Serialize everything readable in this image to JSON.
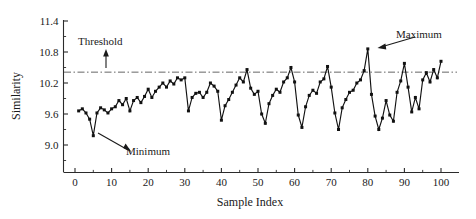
{
  "chart_data": {
    "type": "line",
    "title": "",
    "xlabel": "Sample Index",
    "ylabel": "Similarity",
    "xlim": [
      -2,
      104
    ],
    "ylim": [
      8.7,
      11.45
    ],
    "grid": false,
    "legend": null,
    "y_ticks": [
      "9.0",
      "9.6",
      "10.2",
      "10.8",
      "11.4"
    ],
    "y_tick_values": [
      9.0,
      9.6,
      10.2,
      10.8,
      11.4
    ],
    "x_ticks": [
      "0",
      "10",
      "20",
      "30",
      "40",
      "50",
      "60",
      "70",
      "80",
      "90",
      "100"
    ],
    "x_tick_values": [
      0,
      10,
      20,
      30,
      40,
      50,
      60,
      70,
      80,
      90,
      100
    ],
    "minor_ticks": true,
    "marker": "square",
    "series": [
      {
        "name": "Similarity",
        "x": [
          1,
          2,
          3,
          4,
          5,
          6,
          7,
          8,
          9,
          10,
          11,
          12,
          13,
          14,
          15,
          16,
          17,
          18,
          19,
          20,
          21,
          22,
          23,
          24,
          25,
          26,
          27,
          28,
          29,
          30,
          31,
          32,
          33,
          34,
          35,
          36,
          37,
          38,
          39,
          40,
          41,
          42,
          43,
          44,
          45,
          46,
          47,
          48,
          49,
          50,
          51,
          52,
          53,
          54,
          55,
          56,
          57,
          58,
          59,
          60,
          61,
          62,
          63,
          64,
          65,
          66,
          67,
          68,
          69,
          70,
          71,
          72,
          73,
          74,
          75,
          76,
          77,
          78,
          79,
          80,
          81,
          82,
          83,
          84,
          85,
          86,
          87,
          88,
          89,
          90,
          91,
          92,
          93,
          94,
          95,
          96,
          97,
          98,
          99,
          100
        ],
        "values": [
          9.66,
          9.7,
          9.62,
          9.5,
          9.18,
          9.62,
          9.72,
          9.68,
          9.62,
          9.7,
          9.74,
          9.86,
          9.78,
          9.9,
          9.66,
          9.86,
          9.92,
          9.82,
          9.94,
          10.08,
          9.92,
          10.04,
          10.12,
          10.2,
          10.12,
          10.24,
          10.18,
          10.3,
          10.26,
          10.3,
          9.66,
          9.92,
          10.0,
          10.02,
          9.92,
          10.02,
          10.2,
          10.14,
          10.04,
          9.48,
          9.76,
          9.88,
          10.02,
          10.16,
          10.3,
          10.22,
          10.46,
          10.1,
          9.98,
          10.04,
          9.6,
          9.42,
          9.8,
          9.96,
          10.08,
          10.02,
          10.22,
          10.3,
          10.5,
          10.22,
          9.58,
          9.34,
          9.74,
          9.96,
          10.06,
          10.0,
          10.22,
          10.28,
          10.52,
          10.12,
          9.62,
          9.3,
          9.72,
          9.88,
          10.02,
          10.06,
          10.2,
          10.26,
          10.44,
          10.86,
          9.98,
          9.56,
          9.3,
          9.52,
          9.86,
          9.58,
          9.46,
          10.02,
          10.24,
          10.58,
          10.12,
          9.64,
          9.92,
          9.7,
          10.26,
          10.4,
          10.22,
          10.46,
          10.3,
          10.62
        ]
      }
    ],
    "threshold": {
      "value": 10.41,
      "label": "Threshold",
      "style": "dash-dot"
    },
    "annotations": [
      {
        "name": "maximum",
        "label": "Maximum",
        "x": 80,
        "y": 10.86
      },
      {
        "name": "minimum",
        "label": "Minimum",
        "x": 5,
        "y": 9.18
      }
    ]
  }
}
